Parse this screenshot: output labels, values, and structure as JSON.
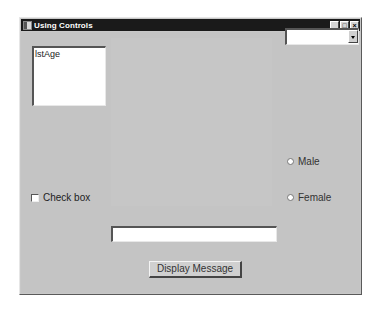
{
  "window": {
    "title": "Using Controls",
    "controls": {
      "minimize": "_",
      "maximize": "□",
      "close": "×"
    }
  },
  "form": {
    "listbox": {
      "label": "lstAge"
    },
    "combobox": {
      "value": ""
    },
    "checkbox": {
      "label": "Check box",
      "checked": false
    },
    "radios": [
      {
        "label": "Male",
        "selected": false
      },
      {
        "label": "Female",
        "selected": false
      }
    ],
    "textbox": {
      "value": ""
    },
    "button": {
      "label": "Display Message"
    }
  },
  "colors": {
    "titlebar": "#1a1a1a",
    "form_bg": "#c4c4c4",
    "control_bg": "#ffffff"
  }
}
